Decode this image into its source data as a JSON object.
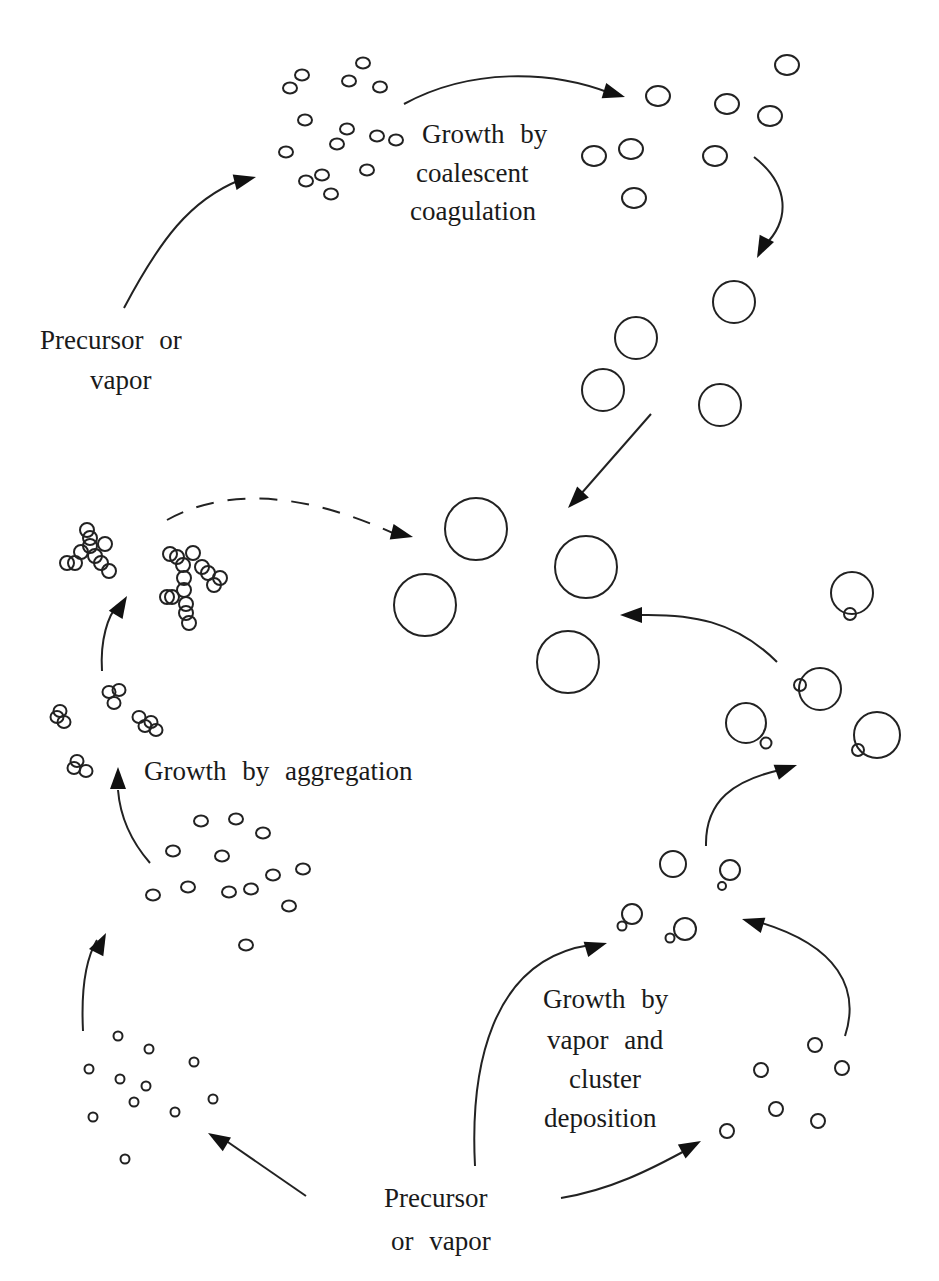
{
  "labels": {
    "precursor_top_line1": "Precursor    or",
    "precursor_top_line2": "vapor",
    "coalescent_line1": "Growth   by",
    "coalescent_line2": "coalescent",
    "coalescent_line3": "coagulation",
    "aggregation": "Growth   by   aggregation",
    "deposition_line1": "Growth   by",
    "deposition_line2": "vapor   and",
    "deposition_line3": "cluster",
    "deposition_line4": "deposition",
    "precursor_bottom_line1": "Precursor",
    "precursor_bottom_line2": "or  vapor"
  },
  "stages": [
    {
      "id": "nuclei-top",
      "description": "small primary particles from precursor",
      "particle_count": 16
    },
    {
      "id": "coalesced-medium",
      "description": "medium droplets after coalescent coagulation",
      "particle_count": 8
    },
    {
      "id": "coalesced-large",
      "description": "larger droplets",
      "particle_count": 4
    },
    {
      "id": "final-large",
      "description": "final large spherical particles",
      "particle_count": 4
    },
    {
      "id": "nuclei-bottom-left",
      "description": "small nuclei from precursor",
      "particle_count": 12
    },
    {
      "id": "primary-particles",
      "description": "primary particles before aggregation",
      "particle_count": 14
    },
    {
      "id": "small-aggregates",
      "description": "small aggregates (doublets/triplets)",
      "particle_count": 4
    },
    {
      "id": "fractal-aggregates",
      "description": "branched fractal aggregates",
      "particle_count": 2
    },
    {
      "id": "nuclei-bottom-right",
      "description": "small nuclei for vapor/cluster deposition",
      "particle_count": 6
    },
    {
      "id": "growing-with-clusters",
      "description": "particles with attached clusters",
      "particle_count": 4
    },
    {
      "id": "grown-with-clusters",
      "description": "grown particles with attached clusters",
      "particle_count": 4
    }
  ],
  "arrows": [
    {
      "from": "precursor-top",
      "to": "nuclei-top",
      "style": "solid"
    },
    {
      "from": "nuclei-top",
      "to": "coalesced-medium",
      "style": "solid"
    },
    {
      "from": "coalesced-medium",
      "to": "coalesced-large",
      "style": "solid"
    },
    {
      "from": "coalesced-large",
      "to": "final-large",
      "style": "solid"
    },
    {
      "from": "precursor-bottom",
      "to": "nuclei-bottom-left",
      "style": "solid"
    },
    {
      "from": "nuclei-bottom-left",
      "to": "primary-particles",
      "style": "solid"
    },
    {
      "from": "primary-particles",
      "to": "small-aggregates",
      "style": "solid"
    },
    {
      "from": "small-aggregates",
      "to": "fractal-aggregates",
      "style": "solid"
    },
    {
      "from": "fractal-aggregates",
      "to": "final-large",
      "style": "dashed"
    },
    {
      "from": "precursor-bottom",
      "to": "growing-with-clusters",
      "style": "solid"
    },
    {
      "from": "precursor-bottom",
      "to": "nuclei-bottom-right",
      "style": "solid"
    },
    {
      "from": "nuclei-bottom-right",
      "to": "growing-with-clusters",
      "style": "solid"
    },
    {
      "from": "growing-with-clusters",
      "to": "grown-with-clusters",
      "style": "solid"
    },
    {
      "from": "grown-with-clusters",
      "to": "final-large",
      "style": "solid"
    }
  ]
}
